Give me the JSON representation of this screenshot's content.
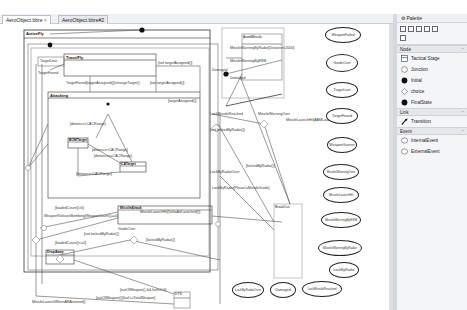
{
  "tabs": [
    {
      "label": "AeroObject.bbre ☓",
      "active": true
    },
    {
      "label": "AeroObject.bbre#2",
      "active": false
    }
  ],
  "states": {
    "activefly": "ActiveFly",
    "travelfly": "TravelFly",
    "attacking": "Attacking",
    "bomtarget": "BOMTarget",
    "catarget": "CATarget",
    "missileattack": "MissileAttack",
    "dropaway": "DropAway",
    "avoidmissile": "AvoidMissile",
    "breakout": "BreakOut",
    "dts": "DTS",
    "targetlost_state": "TargetLost"
  },
  "labels": {
    "targetfound_assign": "TargetFound[targetAssigned()]/changeTarget()",
    "not_target_assigned_top": "[not targetAssigned()]",
    "not_target_assigned_mid": "[not targetAssigned()]",
    "target_assigned": "[targetAssigned()]",
    "dist_gt_1": "[distance>CACRange]",
    "dist_gt_2": "[distance>CACRange]",
    "dist_lt": "[distance<=CACRange]",
    "dist_gt_3": "[distance>CACRange]",
    "loaded_count_1": "[loadedCount()>0]",
    "weapon_release": "WeaponReleaseBombing[WeaponCount()==0]",
    "missile_launch_hit": "MissileLaunchHit[DeltaAttLaunched()]",
    "guide_over": "GuideOver",
    "not_locked_radar": "[not lockedByRadar()]",
    "locked_radar": "[lockedByRadar()]",
    "loaded_count_2": "[loadedCount()<=0]",
    "outofweapon_fuel": "[outOfWeapon() && fuel<0.6]",
    "missile_launch_aam": "MissileLaunchWhenAMAssisted()",
    "outofweapon_fuel2": "[outOfWeapon()||fuel<=TotalWeapon]",
    "missile_warning_radar": "MissileWarningByRadar[Distance<2000]",
    "missile_warning_esm": "MissileWarningByESM",
    "damaged_1": "Damaged",
    "damaged_2": "Damaged",
    "lock_missile_reached": "LockMissileReached",
    "not_locked_radar_2": "[not lockedByRadar()]",
    "missile_warning_over": "MissileWarningOver",
    "missile_launch_at": "MissileLaunchHit[AAMLaunched()]",
    "locked_radar_2": "[lockedByRadar()]",
    "lockbyradar_over": "LockByRadarOver",
    "lockbyradar_phase": "LockByRadar[Phase!=MissileGuide]",
    "target_lost_small": "TargetLost",
    "target_found_small": "TargetFound"
  },
  "events": {
    "right": [
      "WeaponFailed",
      "GuideOver",
      "TargetLost",
      "TargetFound",
      "WeaponGunner",
      "MissileWarningOver",
      "MissileLaunchHit",
      "MissileWarningByESM",
      "MissileWarningByRadar",
      "LockByRadar"
    ],
    "bottom": [
      "LockByRadarOver",
      "Damaged",
      "LockMissileReached"
    ]
  },
  "palette": {
    "title": "Palette",
    "drawers": [
      {
        "name": "Node",
        "entries": [
          "Tactical Stage",
          "Junction",
          "Initial",
          "choice",
          "FinalState"
        ]
      },
      {
        "name": "Link",
        "entries": [
          "Transition"
        ]
      },
      {
        "name": "Event",
        "entries": [
          "InternalEvent",
          "ExternalEvent"
        ]
      }
    ]
  }
}
